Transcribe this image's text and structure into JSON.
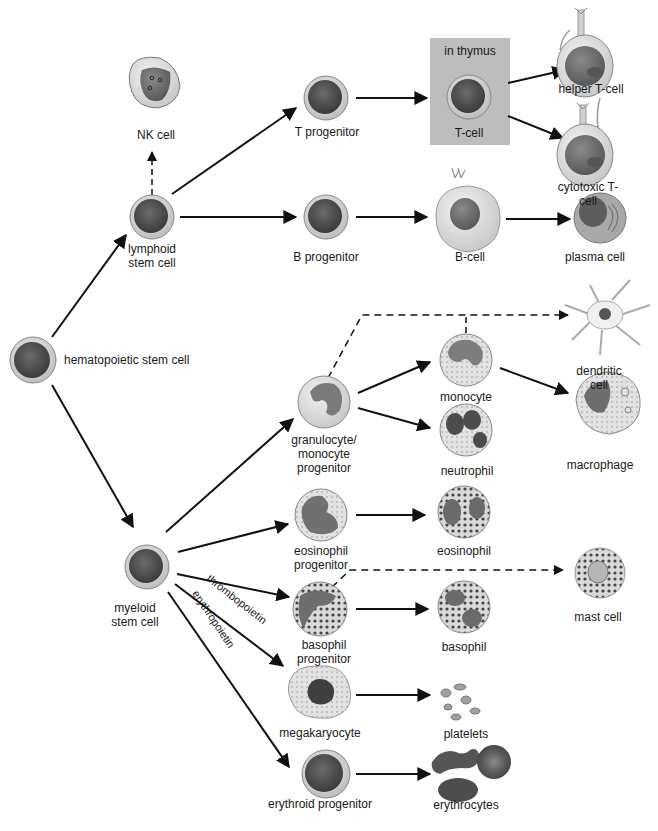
{
  "diagram": {
    "type": "hematopoiesis-lineage-tree",
    "thymus_box": {
      "label": "in thymus",
      "color": "#bebebe"
    },
    "colors": {
      "nucleus_dark": "#4a4a4a",
      "stem_ring": "#d8d8d8",
      "cytoplasm": "#e4e4e4",
      "nucleus_medium": "#6a6a6a",
      "arrow": "#111111",
      "granule": "#3c3c3c"
    },
    "nodes": [
      {
        "id": "hsc",
        "label": "hematopoietic stem cell"
      },
      {
        "id": "lymphoid",
        "label": "lymphoid\nstem cell"
      },
      {
        "id": "nk",
        "label": "NK cell"
      },
      {
        "id": "tprog",
        "label": "T progenitor"
      },
      {
        "id": "tcell",
        "label": "T-cell"
      },
      {
        "id": "helper",
        "label": "helper T-cell"
      },
      {
        "id": "cytotoxic",
        "label": "cytotoxic T-cell"
      },
      {
        "id": "bprog",
        "label": "B progenitor"
      },
      {
        "id": "bcell",
        "label": "B-cell"
      },
      {
        "id": "plasma",
        "label": "plasma cell"
      },
      {
        "id": "myeloid",
        "label": "myeloid\nstem cell"
      },
      {
        "id": "gmp",
        "label": "granulocyte/\nmonocyte\nprogenitor"
      },
      {
        "id": "monocyte",
        "label": "monocyte"
      },
      {
        "id": "neutrophil",
        "label": "neutrophil"
      },
      {
        "id": "dendritic",
        "label": "dendritic cell"
      },
      {
        "id": "macrophage",
        "label": "macrophage"
      },
      {
        "id": "eoprog",
        "label": "eosinophil\nprogenitor"
      },
      {
        "id": "eosinophil",
        "label": "eosinophil"
      },
      {
        "id": "basoprog",
        "label": "basophil\nprogenitor"
      },
      {
        "id": "basophil",
        "label": "basophil"
      },
      {
        "id": "mast",
        "label": "mast cell"
      },
      {
        "id": "mega",
        "label": "megakaryocyte"
      },
      {
        "id": "platelets",
        "label": "platelets"
      },
      {
        "id": "eryprog",
        "label": "erythroid progenitor"
      },
      {
        "id": "erythrocytes",
        "label": "erythrocytes"
      }
    ],
    "edge_labels": {
      "thrombopoietin": "thrombopoietin",
      "erythropoietin": "erythropoietin"
    },
    "edges": [
      {
        "from": "hsc",
        "to": "lymphoid",
        "style": "solid"
      },
      {
        "from": "hsc",
        "to": "myeloid",
        "style": "solid"
      },
      {
        "from": "lymphoid",
        "to": "nk",
        "style": "dashed"
      },
      {
        "from": "lymphoid",
        "to": "tprog",
        "style": "solid"
      },
      {
        "from": "lymphoid",
        "to": "bprog",
        "style": "solid"
      },
      {
        "from": "tprog",
        "to": "tcell",
        "style": "solid"
      },
      {
        "from": "tcell",
        "to": "helper",
        "style": "solid"
      },
      {
        "from": "tcell",
        "to": "cytotoxic",
        "style": "solid"
      },
      {
        "from": "bprog",
        "to": "bcell",
        "style": "solid"
      },
      {
        "from": "bcell",
        "to": "plasma",
        "style": "solid"
      },
      {
        "from": "myeloid",
        "to": "gmp",
        "style": "solid"
      },
      {
        "from": "myeloid",
        "to": "eoprog",
        "style": "solid"
      },
      {
        "from": "myeloid",
        "to": "basoprog",
        "style": "solid"
      },
      {
        "from": "myeloid",
        "to": "mega",
        "style": "solid",
        "label": "thrombopoietin"
      },
      {
        "from": "myeloid",
        "to": "eryprog",
        "style": "solid",
        "label": "erythropoietin"
      },
      {
        "from": "gmp",
        "to": "monocyte",
        "style": "solid"
      },
      {
        "from": "gmp",
        "to": "neutrophil",
        "style": "solid"
      },
      {
        "from": "gmp",
        "to": "dendritic",
        "style": "dashed"
      },
      {
        "from": "monocyte",
        "to": "dendritic",
        "style": "dashed"
      },
      {
        "from": "monocyte",
        "to": "macrophage",
        "style": "solid"
      },
      {
        "from": "eoprog",
        "to": "eosinophil",
        "style": "solid"
      },
      {
        "from": "basoprog",
        "to": "basophil",
        "style": "solid"
      },
      {
        "from": "basoprog",
        "to": "mast",
        "style": "dashed"
      },
      {
        "from": "mega",
        "to": "platelets",
        "style": "solid"
      },
      {
        "from": "eryprog",
        "to": "erythrocytes",
        "style": "solid"
      }
    ]
  }
}
